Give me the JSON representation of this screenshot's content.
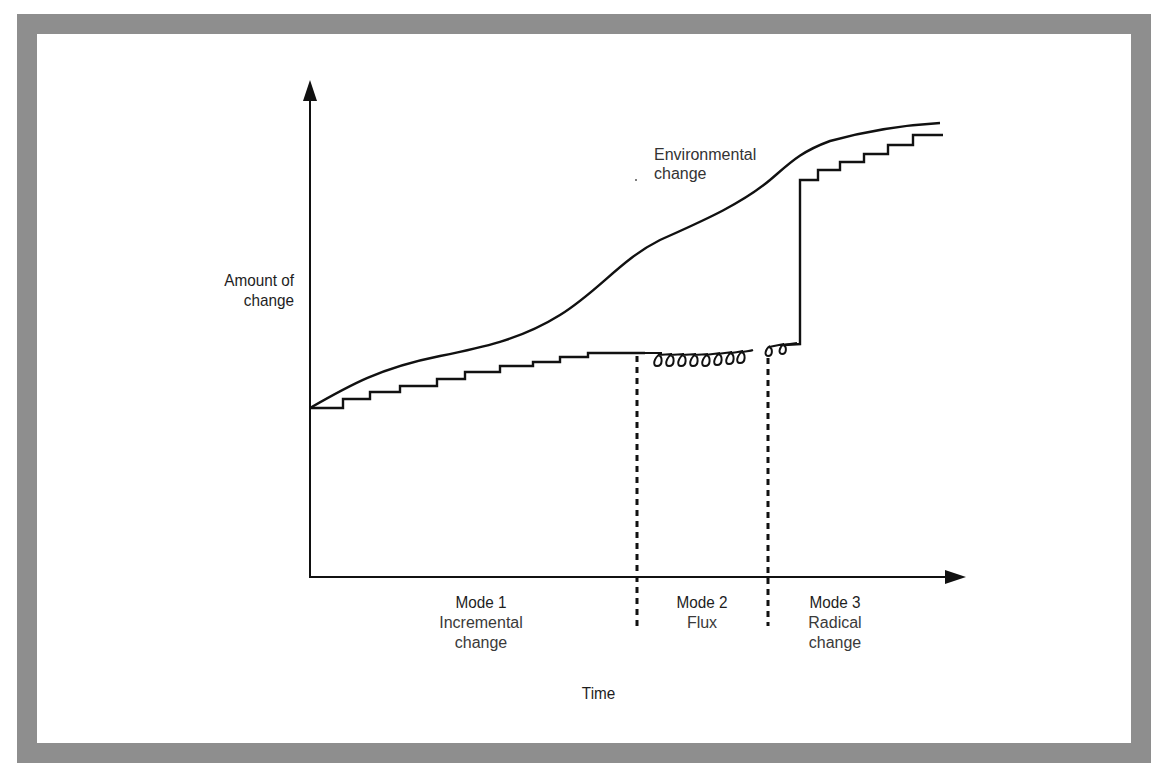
{
  "figure": {
    "y_axis_label_line1": "Amount of",
    "y_axis_label_line2": "change",
    "x_axis_label": "Time",
    "curve_label_line1": "Environmental",
    "curve_label_line2": "change",
    "modes": [
      {
        "title": "Mode 1",
        "sub_line1": "Incremental",
        "sub_line2": "change"
      },
      {
        "title": "Mode 2",
        "sub_line1": "Flux",
        "sub_line2": ""
      },
      {
        "title": "Mode 3",
        "sub_line1": "Radical",
        "sub_line2": "change"
      }
    ]
  },
  "colors": {
    "frame": "#8e8e8e",
    "line": "#111111",
    "background": "#ffffff"
  }
}
